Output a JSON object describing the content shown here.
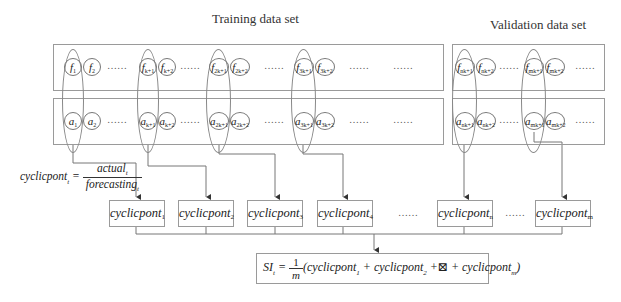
{
  "titles": {
    "training": "Training data set",
    "validation": "Validation data set"
  },
  "training": {
    "forecast_row": [
      {
        "base": "f",
        "sub": "1"
      },
      {
        "base": "f",
        "sub": "2"
      },
      {
        "base": "f",
        "sub": "k+1"
      },
      {
        "base": "f",
        "sub": "k+2"
      },
      {
        "base": "f",
        "sub": "2k+1"
      },
      {
        "base": "f",
        "sub": "2k+2"
      },
      {
        "base": "f",
        "sub": "3k+1"
      },
      {
        "base": "f",
        "sub": "3k+2"
      }
    ],
    "actual_row": [
      {
        "base": "a",
        "sub": "1"
      },
      {
        "base": "a",
        "sub": "2"
      },
      {
        "base": "a",
        "sub": "k+1"
      },
      {
        "base": "a",
        "sub": "k+2"
      },
      {
        "base": "a",
        "sub": "2k+1"
      },
      {
        "base": "a",
        "sub": "2k+2"
      },
      {
        "base": "a",
        "sub": "3k+1"
      },
      {
        "base": "a",
        "sub": "3k+2"
      }
    ]
  },
  "validation": {
    "forecast_row": [
      {
        "base": "f",
        "sub": "nk+1"
      },
      {
        "base": "f",
        "sub": "nk+2"
      },
      {
        "base": "f",
        "sub": "mk+1"
      },
      {
        "base": "f",
        "sub": "mk+2"
      }
    ],
    "actual_row": [
      {
        "base": "a",
        "sub": "nk+1"
      },
      {
        "base": "a",
        "sub": "nk+2"
      },
      {
        "base": "a",
        "sub": "mk+1"
      },
      {
        "base": "a",
        "sub": "mk+2"
      }
    ]
  },
  "ellipsis": "……",
  "formula": {
    "lhs": "cyclicpont",
    "lhs_sub": "t",
    "eq": "=",
    "numerator": "actual",
    "numerator_sub": "t",
    "denominator": "forecasting",
    "denominator_sub": "t"
  },
  "cyclic_boxes": [
    {
      "label": "cyclicpont",
      "sub": "1"
    },
    {
      "label": "cyclicpont",
      "sub": "2"
    },
    {
      "label": "cyclicpont",
      "sub": "3"
    },
    {
      "label": "cyclicpont",
      "sub": "4"
    },
    {
      "label": "cyclicpont",
      "sub": "n"
    },
    {
      "label": "cyclicpont",
      "sub": "m"
    }
  ],
  "si_formula": {
    "lhs": "SI",
    "lhs_sub": "t",
    "eq": "=",
    "frac_num": "1",
    "frac_den": "m",
    "body": "(cyclicpont",
    "term1_sub": "1",
    "plus1": " + cyclicpont",
    "term2_sub": "2",
    "plus2": " +⊠  + cyclicpont",
    "term3_sub": "m",
    "close": ")"
  },
  "colors": {
    "line": "#777777",
    "box_border": "#9a9a9a",
    "text": "#222222"
  }
}
